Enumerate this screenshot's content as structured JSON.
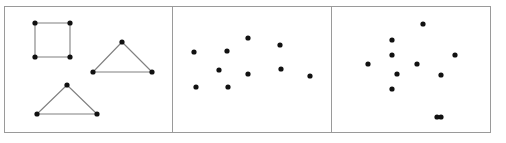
{
  "figure": {
    "width": 506,
    "height": 143,
    "background_color": "#ffffff",
    "border_color": "#9a9a9a",
    "border_width": 1,
    "point_color": "#111111",
    "point_radius": 2.6,
    "edge_color": "#808080",
    "edge_width": 1.1,
    "panel_count": 3
  },
  "chart_data": {
    "type": "scatter",
    "title": "",
    "xlabel": "",
    "ylabel": "",
    "grid": false,
    "legend": false,
    "panels": [
      {
        "name": "panel-shapes",
        "index": 0,
        "frame": {
          "x": 4,
          "y": 6,
          "width": 168,
          "height": 126
        },
        "has_edges": true,
        "point_count": 10,
        "edge_count": 10,
        "shapes": [
          {
            "name": "square",
            "kind": "square",
            "points": [
              {
                "x": 35,
                "y": 23
              },
              {
                "x": 70,
                "y": 23
              },
              {
                "x": 70,
                "y": 57
              },
              {
                "x": 35,
                "y": 57
              }
            ],
            "edges": [
              [
                0,
                1
              ],
              [
                1,
                2
              ],
              [
                2,
                3
              ],
              [
                3,
                0
              ]
            ]
          },
          {
            "name": "triangle-right",
            "kind": "triangle",
            "points": [
              {
                "x": 122,
                "y": 42
              },
              {
                "x": 93,
                "y": 72
              },
              {
                "x": 152,
                "y": 72
              }
            ],
            "edges": [
              [
                0,
                1
              ],
              [
                1,
                2
              ],
              [
                2,
                0
              ]
            ]
          },
          {
            "name": "triangle-bottom",
            "kind": "triangle",
            "points": [
              {
                "x": 67,
                "y": 85
              },
              {
                "x": 37,
                "y": 114
              },
              {
                "x": 97,
                "y": 114
              }
            ],
            "edges": [
              [
                0,
                1
              ],
              [
                1,
                2
              ],
              [
                2,
                0
              ]
            ]
          }
        ]
      },
      {
        "name": "panel-scatter-middle",
        "index": 1,
        "frame": {
          "x": 172,
          "y": 6,
          "width": 159,
          "height": 126
        },
        "has_edges": false,
        "point_count": 10,
        "edge_count": 0,
        "points": [
          {
            "x": 194,
            "y": 52
          },
          {
            "x": 227,
            "y": 51
          },
          {
            "x": 248,
            "y": 38
          },
          {
            "x": 219,
            "y": 70
          },
          {
            "x": 196,
            "y": 87
          },
          {
            "x": 228,
            "y": 87
          },
          {
            "x": 248,
            "y": 74
          },
          {
            "x": 280,
            "y": 45
          },
          {
            "x": 281,
            "y": 69
          },
          {
            "x": 310,
            "y": 76
          }
        ]
      },
      {
        "name": "panel-scatter-right",
        "index": 2,
        "frame": {
          "x": 331,
          "y": 6,
          "width": 159,
          "height": 126
        },
        "has_edges": false,
        "point_count": 11,
        "edge_count": 0,
        "points": [
          {
            "x": 423,
            "y": 24
          },
          {
            "x": 392,
            "y": 40
          },
          {
            "x": 392,
            "y": 55
          },
          {
            "x": 368,
            "y": 64
          },
          {
            "x": 417,
            "y": 64
          },
          {
            "x": 455,
            "y": 55
          },
          {
            "x": 397,
            "y": 74
          },
          {
            "x": 441,
            "y": 75
          },
          {
            "x": 392,
            "y": 89
          },
          {
            "x": 441,
            "y": 117
          },
          {
            "x": 437,
            "y": 117
          }
        ]
      }
    ]
  }
}
